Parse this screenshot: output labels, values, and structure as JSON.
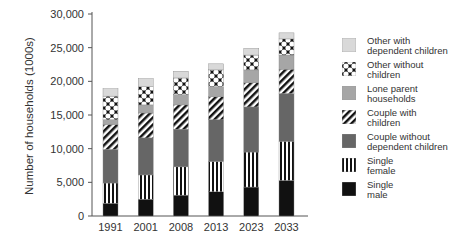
{
  "chart_data": {
    "type": "bar",
    "stacked": true,
    "title": "",
    "xlabel": "",
    "ylabel": "Number of households (1000s)",
    "ylim": [
      0,
      30000
    ],
    "yticks": [
      0,
      5000,
      10000,
      15000,
      20000,
      25000,
      30000
    ],
    "ytick_labels": [
      "0",
      "5,000",
      "10,000",
      "15,000",
      "20,000",
      "25,000",
      "30,000"
    ],
    "grid": false,
    "legend_position": "right",
    "categories": [
      "1991",
      "2001",
      "2008",
      "2013",
      "2023",
      "2033"
    ],
    "series": [
      {
        "name": "Single male",
        "pattern": "solid-black",
        "values": [
          1900,
          2500,
          3100,
          3600,
          4300,
          5300
        ]
      },
      {
        "name": "Single female",
        "pattern": "vertical-stripes",
        "values": [
          3000,
          3600,
          4200,
          4500,
          5200,
          5800
        ]
      },
      {
        "name": "Couple without dependent children",
        "pattern": "dark-gray",
        "values": [
          5000,
          5500,
          5600,
          6200,
          6700,
          7100
        ]
      },
      {
        "name": "Couple with children",
        "pattern": "diagonal-stripes",
        "values": [
          3700,
          3700,
          3600,
          3400,
          3600,
          3600
        ]
      },
      {
        "name": "Lone parent households",
        "pattern": "mid-gray",
        "values": [
          700,
          1200,
          1500,
          1500,
          1900,
          2100
        ]
      },
      {
        "name": "Other without children",
        "pattern": "black-white-lattice",
        "values": [
          3500,
          2700,
          2500,
          2500,
          2200,
          2400
        ]
      },
      {
        "name": "Other with dependent children",
        "pattern": "light-gray",
        "values": [
          1100,
          1200,
          1000,
          900,
          1000,
          900
        ]
      }
    ],
    "totals": [
      18900,
      20400,
      21500,
      22600,
      24900,
      27200
    ]
  },
  "legend": {
    "items": [
      {
        "line1": "Other with",
        "line2": "dependent children",
        "pattern": "light-gray"
      },
      {
        "line1": "Other without",
        "line2": "children",
        "pattern": "black-white-lattice"
      },
      {
        "line1": "Lone parent",
        "line2": "households",
        "pattern": "mid-gray"
      },
      {
        "line1": "Couple with",
        "line2": "children",
        "pattern": "diagonal-stripes"
      },
      {
        "line1": "Couple without",
        "line2": "dependent children",
        "pattern": "dark-gray"
      },
      {
        "line1": "Single",
        "line2": "female",
        "pattern": "vertical-stripes"
      },
      {
        "line1": "Single",
        "line2": "male",
        "pattern": "solid-black"
      }
    ]
  },
  "colors": {
    "solid-black": "#111111",
    "dark-gray": "#666666",
    "mid-gray": "#a6a6a6",
    "light-gray": "#d9d9d9",
    "axis": "#555555"
  }
}
